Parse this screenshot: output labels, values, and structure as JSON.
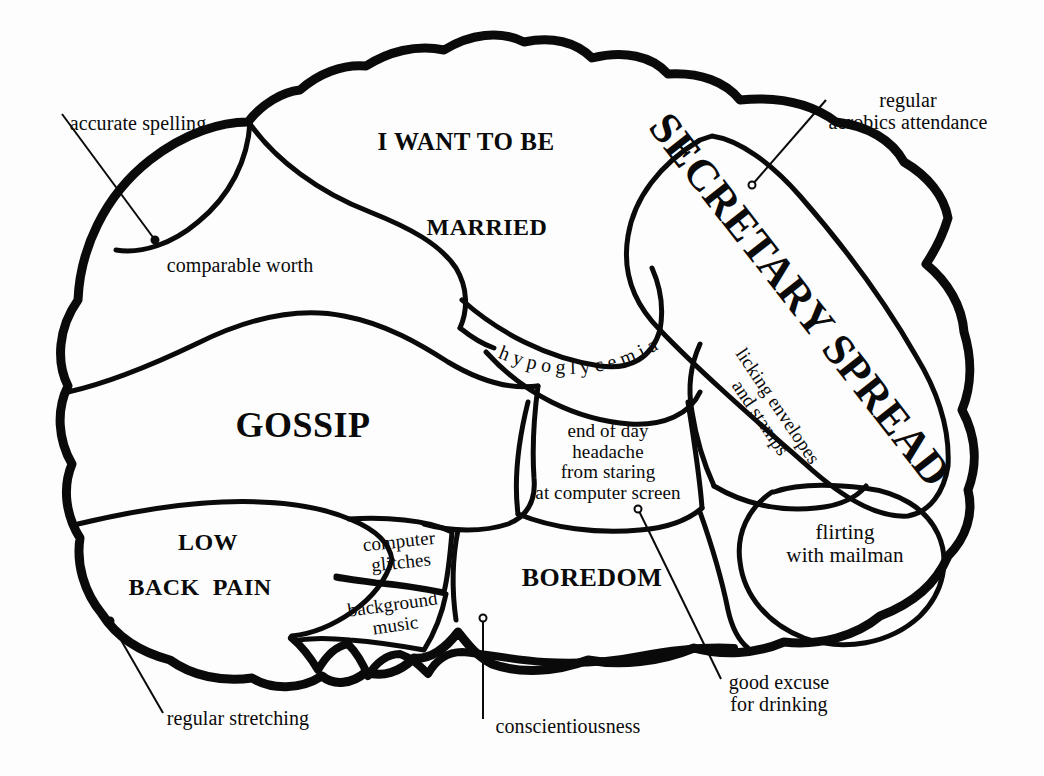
{
  "diagram": {
    "type": "labeled-anatomy-cartoon",
    "ink_color": "#0a0a0a",
    "paper_color": "#fdfdfd"
  },
  "regions": [
    {
      "id": "i-want-to-be",
      "text": "I WANT TO BE",
      "style": "caps",
      "x": 466,
      "y": 141,
      "size": 25,
      "rotate": 0
    },
    {
      "id": "married",
      "text": "MARRIED",
      "style": "caps",
      "x": 487,
      "y": 228,
      "size": 24,
      "rotate": 0
    },
    {
      "id": "secretary-spread",
      "text": "SECRETARY SPREAD",
      "style": "caps",
      "x": 800,
      "y": 300,
      "size": 44,
      "rotate": 52
    },
    {
      "id": "gossip",
      "text": "GOSSIP",
      "style": "caps",
      "x": 303,
      "y": 425,
      "size": 36,
      "rotate": 0
    },
    {
      "id": "hypoglycemia",
      "text": "hypoglycemia",
      "style": "arc",
      "x": 590,
      "y": 348,
      "size": 19,
      "rotate": 0
    },
    {
      "id": "licking-envelopes",
      "text": "licking envelopes\nand stamps",
      "style": "plain",
      "x": 769,
      "y": 412,
      "size": 19,
      "rotate": 56
    },
    {
      "id": "end-of-day-headache",
      "text": "end of day\nheadache\nfrom staring\nat computer screen",
      "style": "plain",
      "x": 608,
      "y": 462,
      "size": 19,
      "rotate": 0
    },
    {
      "id": "flirting-mailman",
      "text": "flirting\nwith mailman",
      "style": "plain",
      "x": 845,
      "y": 544,
      "size": 21,
      "rotate": 0
    },
    {
      "id": "low-back-pain",
      "text": "LOW",
      "style": "caps",
      "x": 208,
      "y": 543,
      "size": 24,
      "rotate": 0
    },
    {
      "id": "low-back-pain-2",
      "text": "BACK  PAIN",
      "style": "caps",
      "x": 200,
      "y": 588,
      "size": 24,
      "rotate": 0
    },
    {
      "id": "boredom",
      "text": "BOREDOM",
      "style": "caps",
      "x": 592,
      "y": 578,
      "size": 26,
      "rotate": 0
    },
    {
      "id": "computer-glitches",
      "text": "computer\nglitches",
      "style": "plain",
      "x": 400,
      "y": 552,
      "size": 19,
      "rotate": -6
    },
    {
      "id": "background-music",
      "text": "background\nmusic",
      "style": "plain",
      "x": 394,
      "y": 615,
      "size": 19,
      "rotate": -8
    }
  ],
  "annotations": [
    {
      "id": "accurate-spelling",
      "text": "accurate spelling",
      "x": 138,
      "y": 124,
      "size": 20,
      "rotate": 0,
      "dot": [
        155,
        240
      ],
      "leader": [
        [
          62,
          114
        ],
        [
          155,
          240
        ]
      ]
    },
    {
      "id": "comparable-worth",
      "text": "comparable worth",
      "x": 240,
      "y": 266,
      "size": 20,
      "rotate": 0,
      "dot": null,
      "leader": null
    },
    {
      "id": "regular-aerobics",
      "text": "regular\naerobics attendance",
      "x": 908,
      "y": 112,
      "size": 20,
      "rotate": 0,
      "dot": [
        752,
        185
      ],
      "leader": [
        [
          826,
          100
        ],
        [
          752,
          185
        ]
      ]
    },
    {
      "id": "regular-stretching",
      "text": "regular stretching",
      "x": 238,
      "y": 719,
      "size": 20,
      "rotate": 0,
      "dot": [
        110,
        621
      ],
      "leader": [
        [
          110,
          621
        ],
        [
          163,
          713
        ]
      ]
    },
    {
      "id": "conscientiousness",
      "text": "conscientiousness",
      "x": 568,
      "y": 727,
      "size": 20,
      "rotate": 0,
      "dot": [
        483,
        618
      ],
      "leader": [
        [
          483,
          618
        ],
        [
          483,
          719
        ]
      ]
    },
    {
      "id": "good-excuse",
      "text": "good excuse\nfor drinking",
      "x": 779,
      "y": 694,
      "size": 20,
      "rotate": 0,
      "dot": [
        638,
        509
      ],
      "leader": [
        [
          638,
          509
        ],
        [
          721,
          679
        ]
      ]
    }
  ]
}
